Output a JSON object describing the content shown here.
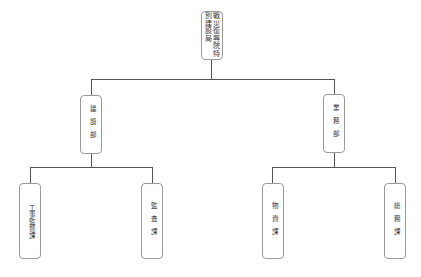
{
  "chart": {
    "root": {
      "label_col1": "戦災復興院",
      "label_col2": "特別建設局"
    },
    "departments": [
      {
        "label": "建設部"
      },
      {
        "label": "業務部"
      }
    ],
    "sections": [
      {
        "label": "工事監督課",
        "parent": "建設部"
      },
      {
        "label": "監査課",
        "parent": "建設部"
      },
      {
        "label": "物資課",
        "parent": "業務部"
      },
      {
        "label": "総務課",
        "parent": "業務部"
      }
    ]
  },
  "colors": {
    "line": "#555555",
    "border": "#9a9a9a",
    "text": "#333333"
  }
}
